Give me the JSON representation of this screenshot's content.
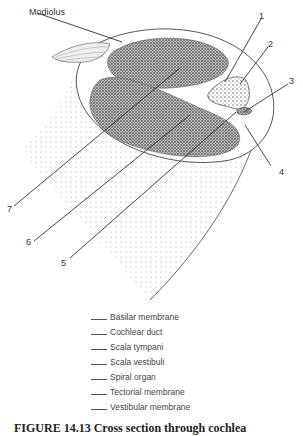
{
  "figure": {
    "structure_label": "Modiolus",
    "callouts": [
      "1",
      "2",
      "3",
      "4",
      "5",
      "6",
      "7"
    ],
    "answer_terms": [
      "Basilar membrane",
      "Cochlear duct",
      "Scala tympani",
      "Scala vestibuli",
      "Spiral organ",
      "Tectorial membrane",
      "Vestibular membrane"
    ],
    "caption": "FIGURE 14.13   Cross section through cochlea"
  }
}
